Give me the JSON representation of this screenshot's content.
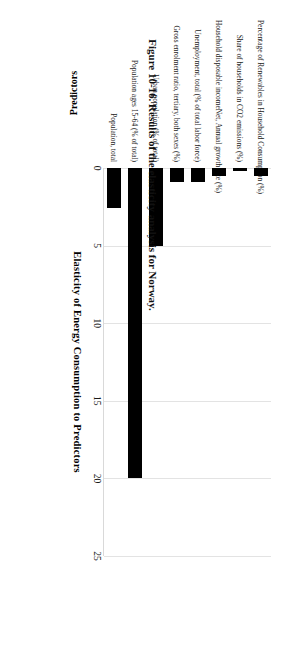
{
  "figure": {
    "caption": "Figure 10-16. Results of the elasticity analysis for Norway."
  },
  "chart_data": {
    "type": "bar",
    "orientation": "vertical-rendered-rotated",
    "title": "",
    "xlabel": "Predictors",
    "ylabel": "Elasticity of Energy Consumption  to Predictors",
    "ylim": [
      0,
      25
    ],
    "yticks": [
      "0",
      "5",
      "10",
      "15",
      "20",
      "25"
    ],
    "grid": true,
    "legend": "none",
    "bar_color": "#000000",
    "categories": [
      "Percentage of Renewables in Household Consumption (%)",
      "Share of households in CO2 emissions (%)",
      "Household disposable incomeNet, Annual growth rate (%)",
      "Unemployment, total (% of total labor force)",
      "Gross enrolment ratio, tertiary, both sexes (%)",
      "Urban population (% of total)",
      "Population ages 15-64 (% of total)",
      "Population, total"
    ],
    "values": [
      0.5,
      0.2,
      0.5,
      0.9,
      0.9,
      5.0,
      20.0,
      2.6
    ]
  }
}
